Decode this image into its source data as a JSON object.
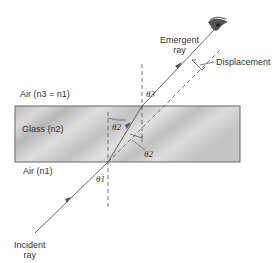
{
  "labels": {
    "emergent_ray": [
      "Emergent",
      "ray"
    ],
    "displacement": "Displacement",
    "air_top": "Air (n3 = n1)",
    "glass": "Glass (n2)",
    "air_bottom": "Air (n1)",
    "incident_ray": [
      "Incident",
      "ray"
    ],
    "theta1": "θ1",
    "theta2_a": "θ2",
    "theta2_b": "θ2",
    "theta3": "θ3"
  },
  "colors": {
    "ray": "#555555",
    "glass_fill": "#c8c8c8",
    "glass_border": "#6a6a6a",
    "text": "#333333"
  },
  "icons": {
    "eye": "eye-icon"
  }
}
